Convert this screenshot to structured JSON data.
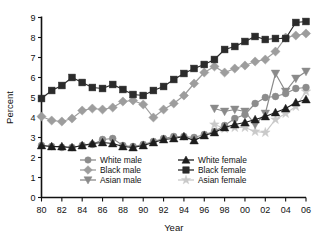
{
  "chart_data": {
    "type": "line",
    "title": "",
    "xlabel": "Year",
    "ylabel": "Percent",
    "xlim": [
      80,
      106
    ],
    "ylim": [
      0,
      9
    ],
    "grid": false,
    "legend_position": "lower-center-inside",
    "x": [
      1980,
      1981,
      1982,
      1983,
      1984,
      1985,
      1986,
      1987,
      1988,
      1989,
      1990,
      1991,
      1992,
      1993,
      1994,
      1995,
      1996,
      1997,
      1998,
      1999,
      2000,
      2001,
      2002,
      2003,
      2004,
      2005,
      2006
    ],
    "xtick_labels": [
      "80",
      "82",
      "84",
      "86",
      "88",
      "90",
      "92",
      "94",
      "96",
      "98",
      "00",
      "02",
      "04",
      "06"
    ],
    "xtick_values": [
      1980,
      1982,
      1984,
      1986,
      1988,
      1990,
      1992,
      1994,
      1996,
      1998,
      2000,
      2002,
      2004,
      2006
    ],
    "ytick_labels": [
      "0",
      "1",
      "2",
      "3",
      "4",
      "5",
      "6",
      "7",
      "8",
      "9"
    ],
    "ytick_values": [
      0,
      1,
      2,
      3,
      4,
      5,
      6,
      7,
      8,
      9
    ],
    "series": [
      {
        "name": "White male",
        "marker": "circle",
        "color": "#8c8c8c",
        "x": [
          1980,
          1981,
          1982,
          1983,
          1984,
          1985,
          1986,
          1987,
          1988,
          1989,
          1990,
          1991,
          1992,
          1993,
          1994,
          1995,
          1996,
          1997,
          1998,
          1999,
          2000,
          2001,
          2002,
          2003,
          2004,
          2005,
          2006
        ],
        "values": [
          2.6,
          2.55,
          2.5,
          2.5,
          2.6,
          2.65,
          2.9,
          2.95,
          2.6,
          2.55,
          2.65,
          2.8,
          2.95,
          3.05,
          3.05,
          3.0,
          3.15,
          3.3,
          3.6,
          3.95,
          4.15,
          4.7,
          5.0,
          5.05,
          5.2,
          5.45,
          5.5
        ]
      },
      {
        "name": "Black male",
        "marker": "diamond",
        "color": "#9d9d9d",
        "x": [
          1980,
          1981,
          1982,
          1983,
          1984,
          1985,
          1986,
          1987,
          1988,
          1989,
          1990,
          1991,
          1992,
          1993,
          1994,
          1995,
          1996,
          1997,
          1998,
          1999,
          2000,
          2001,
          2002,
          2003,
          2004,
          2005,
          2006
        ],
        "values": [
          4.05,
          3.85,
          3.8,
          3.95,
          4.35,
          4.45,
          4.4,
          4.5,
          4.8,
          4.85,
          4.65,
          4.0,
          4.4,
          4.7,
          5.1,
          5.7,
          6.25,
          6.55,
          6.25,
          6.45,
          6.6,
          6.8,
          6.9,
          7.3,
          8.0,
          8.1,
          8.2
        ]
      },
      {
        "name": "Asian male",
        "marker": "triangle-down",
        "color": "#8a8a8a",
        "x": [
          1997,
          1998,
          1999,
          2000,
          2001,
          2002,
          2003,
          2004,
          2005,
          2006
        ],
        "values": [
          4.45,
          4.3,
          4.4,
          4.3,
          3.65,
          4.2,
          6.2,
          5.3,
          5.95,
          6.3
        ]
      },
      {
        "name": "White female",
        "marker": "triangle-up",
        "color": "#1d1d1d",
        "x": [
          1980,
          1981,
          1982,
          1983,
          1984,
          1985,
          1986,
          1987,
          1988,
          1989,
          1990,
          1991,
          1992,
          1993,
          1994,
          1995,
          1996,
          1997,
          1998,
          1999,
          2000,
          2001,
          2002,
          2003,
          2004,
          2005,
          2006
        ],
        "values": [
          2.6,
          2.55,
          2.55,
          2.5,
          2.6,
          2.7,
          2.75,
          2.7,
          2.55,
          2.5,
          2.6,
          2.75,
          2.9,
          2.95,
          3.05,
          2.85,
          3.1,
          3.25,
          3.5,
          3.65,
          3.75,
          3.9,
          4.05,
          4.25,
          4.45,
          4.75,
          4.9
        ]
      },
      {
        "name": "Black female",
        "marker": "square",
        "color": "#2b2b2b",
        "x": [
          1980,
          1981,
          1982,
          1983,
          1984,
          1985,
          1986,
          1987,
          1988,
          1989,
          1990,
          1991,
          1992,
          1993,
          1994,
          1995,
          1996,
          1997,
          1998,
          1999,
          2000,
          2001,
          2002,
          2003,
          2004,
          2005,
          2006
        ],
        "values": [
          4.95,
          5.35,
          5.6,
          6.0,
          5.75,
          5.5,
          5.45,
          5.65,
          5.4,
          5.15,
          5.1,
          5.35,
          5.55,
          5.9,
          6.2,
          6.45,
          6.65,
          6.9,
          7.4,
          7.55,
          7.8,
          8.05,
          7.9,
          7.95,
          7.95,
          8.75,
          8.8
        ]
      },
      {
        "name": "Asian female",
        "marker": "star",
        "color": "#c9c9c9",
        "x": [
          1997,
          1998,
          1999,
          2000,
          2001,
          2002,
          2003,
          2004,
          2005,
          2006
        ],
        "values": [
          3.65,
          3.45,
          3.5,
          3.5,
          3.3,
          3.25,
          3.9,
          4.2,
          4.55,
          5.3
        ]
      }
    ]
  },
  "legend": {
    "items": [
      {
        "label": "White male"
      },
      {
        "label": "White female"
      },
      {
        "label": "Black male"
      },
      {
        "label": "Black female"
      },
      {
        "label": "Asian male"
      },
      {
        "label": "Asian female"
      }
    ]
  },
  "axes": {
    "x_title": "Year",
    "y_title": "Percent"
  }
}
